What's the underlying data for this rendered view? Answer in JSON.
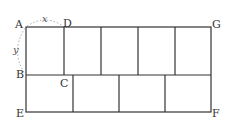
{
  "diagram": {
    "type": "geometric-tiling",
    "points": {
      "A": "A",
      "B": "B",
      "C": "C",
      "D": "D",
      "E": "E",
      "F": "F",
      "G": "G"
    },
    "variables": {
      "x": "x",
      "y": "y"
    },
    "colors": {
      "stroke": "#333333",
      "arc": "#aaaaaa",
      "background": "#ffffff"
    }
  }
}
